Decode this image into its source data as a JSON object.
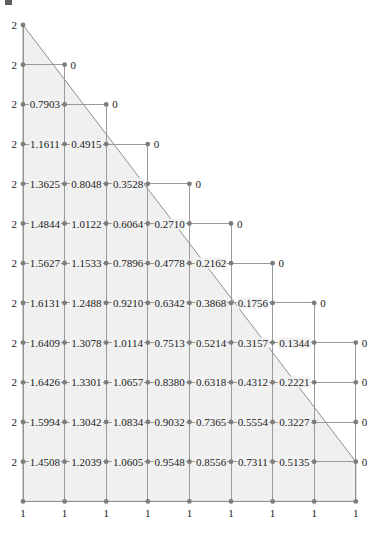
{
  "figure": {
    "type": "triangular-mesh-node-value-diagram",
    "title": "",
    "corner_mark": "partial-glyph",
    "colors": {
      "fill": "#f0f0f0",
      "grid_line": "#9a9a9a",
      "boundary_line": "#8f8f8f",
      "node": "#7d7d7d",
      "text": "#1a1a1a"
    },
    "geometry": {
      "columns": 9,
      "rows": 13,
      "x_positions": [
        23,
        64.6,
        106.2,
        147.8,
        189.4,
        231,
        272.6,
        314.2,
        355.8
      ],
      "y_positions": [
        25,
        64.7,
        104.4,
        144.1,
        183.8,
        223.5,
        263.2,
        302.9,
        342.6,
        382.3,
        422,
        461.7,
        501.4
      ],
      "hypotenuse_from": [
        0,
        0
      ],
      "hypotenuse_to": [
        8,
        9
      ]
    }
  },
  "chart_data": {
    "type": "table",
    "title": "",
    "xlabel": "",
    "ylabel": "",
    "boundary_values": {
      "left_edge": "2",
      "bottom_edge": "1",
      "diagonal_edge": "0",
      "right_edge": "0"
    },
    "rows": [
      {
        "index": 0,
        "labels": [
          "2"
        ]
      },
      {
        "index": 1,
        "labels": [
          "2",
          "0"
        ]
      },
      {
        "index": 2,
        "labels": [
          "2",
          "0.7903",
          "0"
        ]
      },
      {
        "index": 3,
        "labels": [
          "2",
          "1.1611",
          "0.4915",
          "0"
        ]
      },
      {
        "index": 4,
        "labels": [
          "2",
          "1.3625",
          "0.8048",
          "0.3528",
          "0"
        ]
      },
      {
        "index": 5,
        "labels": [
          "2",
          "1.4844",
          "1.0122",
          "0.6064",
          "0.2710",
          "0"
        ]
      },
      {
        "index": 6,
        "labels": [
          "2",
          "1.5627",
          "1.1533",
          "0.7896",
          "0.4778",
          "0.2162",
          "0"
        ]
      },
      {
        "index": 7,
        "labels": [
          "2",
          "1.6131",
          "1.2488",
          "0.9210",
          "0.6342",
          "0.3868",
          "0.1756",
          "0"
        ]
      },
      {
        "index": 8,
        "labels": [
          "2",
          "1.6409",
          "1.3078",
          "1.0114",
          "0.7513",
          "0.5214",
          "0.3157",
          "0.1344",
          "0"
        ]
      },
      {
        "index": 9,
        "labels": [
          "2",
          "1.6426",
          "1.3301",
          "1.0657",
          "0.8380",
          "0.6318",
          "0.4312",
          "0.2221",
          "0"
        ]
      },
      {
        "index": 10,
        "labels": [
          "2",
          "1.5994",
          "1.3042",
          "1.0834",
          "0.9032",
          "0.7365",
          "0.5554",
          "0.3227",
          "0"
        ]
      },
      {
        "index": 11,
        "labels": [
          "2",
          "1.4508",
          "1.2039",
          "1.0605",
          "0.9548",
          "0.8556",
          "0.7311",
          "0.5135",
          "0"
        ]
      },
      {
        "index": 12,
        "labels": [
          "1",
          "1",
          "1",
          "1",
          "1",
          "1",
          "1",
          "1",
          "1"
        ]
      }
    ]
  }
}
